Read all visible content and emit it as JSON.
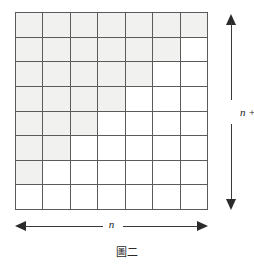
{
  "figure": {
    "caption": "圖二",
    "dimension_horizontal_label": "n",
    "dimension_vertical_label": "n + 1",
    "colors": {
      "shaded_cell": "#f1f1ef",
      "empty_cell": "#ffffff",
      "grid_line": "#5b5b5b",
      "arrow": "#2b2b2b",
      "background": "#ffffff"
    }
  },
  "chart_data": {
    "type": "heatmap",
    "title": "圖二",
    "xlabel": "n",
    "ylabel": "n + 1",
    "columns": 7,
    "rows": 8,
    "row_labels": [
      "row-1",
      "row-2",
      "row-3",
      "row-4",
      "row-5",
      "row-6",
      "row-7",
      "row-8"
    ],
    "column_labels": [
      "col-1",
      "col-2",
      "col-3",
      "col-4",
      "col-5",
      "col-6",
      "col-7"
    ],
    "shaded_counts_per_row": [
      7,
      6,
      5,
      4,
      3,
      2,
      1,
      0
    ],
    "values": [
      [
        1,
        1,
        1,
        1,
        1,
        1,
        1
      ],
      [
        1,
        1,
        1,
        1,
        1,
        1,
        0
      ],
      [
        1,
        1,
        1,
        1,
        1,
        0,
        0
      ],
      [
        1,
        1,
        1,
        1,
        0,
        0,
        0
      ],
      [
        1,
        1,
        1,
        0,
        0,
        0,
        0
      ],
      [
        1,
        1,
        0,
        0,
        0,
        0,
        0
      ],
      [
        1,
        0,
        0,
        0,
        0,
        0,
        0
      ],
      [
        0,
        0,
        0,
        0,
        0,
        0,
        0
      ]
    ],
    "total_cells": 56,
    "shaded_cells": 28,
    "grid": true,
    "legend": []
  }
}
